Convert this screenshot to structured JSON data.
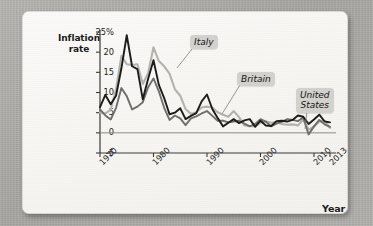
{
  "figure": {
    "y_axis_title_line1": "Inflation",
    "y_axis_title_line2": "rate",
    "x_axis_title": "Year"
  },
  "callouts": {
    "italy": "Italy",
    "britain": "Britain",
    "united_states_line1": "United",
    "united_states_line2": "States"
  },
  "colors": {
    "italy": "#b3b2ae",
    "britain": "#1c1c1c",
    "united_states": "#6e6e6c",
    "axis": "#3a3a38",
    "zero_line": "#8d8d8a",
    "callout_bg": "#d2d1cd",
    "card_bg": "#f8f7f4",
    "page_bg": "#adaca8"
  },
  "chart_data": {
    "type": "line",
    "title": "",
    "subtitle": "",
    "xlabel": "Year",
    "ylabel": "Inflation rate",
    "grid": false,
    "legend_position": "inline-callouts",
    "xlim": [
      1970,
      2013
    ],
    "ylim": [
      -5,
      25
    ],
    "ytick_labels": [
      "25%",
      "20",
      "15",
      "10",
      "5",
      "0",
      "-5"
    ],
    "ytick_values": [
      25,
      20,
      15,
      10,
      5,
      0,
      -5
    ],
    "xtick_labels": [
      "1970",
      "1980",
      "1990",
      "2000",
      "2010",
      "2013"
    ],
    "xtick_values": [
      1970,
      1980,
      1990,
      2000,
      2010,
      2013
    ],
    "x": [
      1970,
      1971,
      1972,
      1973,
      1974,
      1975,
      1976,
      1977,
      1978,
      1979,
      1980,
      1981,
      1982,
      1983,
      1984,
      1985,
      1986,
      1987,
      1988,
      1989,
      1990,
      1991,
      1992,
      1993,
      1994,
      1995,
      1996,
      1997,
      1998,
      1999,
      2000,
      2001,
      2002,
      2003,
      2004,
      2005,
      2006,
      2007,
      2008,
      2009,
      2010,
      2011,
      2012,
      2013
    ],
    "series": [
      {
        "name": "Italy",
        "color": "#b3b2ae",
        "values": [
          5.0,
          4.8,
          5.7,
          10.8,
          19.1,
          17.0,
          16.8,
          17.0,
          12.1,
          14.8,
          21.2,
          17.8,
          16.5,
          14.7,
          10.8,
          9.2,
          5.9,
          4.7,
          5.1,
          6.3,
          6.5,
          6.3,
          5.1,
          4.5,
          4.0,
          5.4,
          3.9,
          1.8,
          1.7,
          1.6,
          2.5,
          2.8,
          2.5,
          2.7,
          2.2,
          2.0,
          2.1,
          1.8,
          3.3,
          0.8,
          1.5,
          2.8,
          3.0,
          1.2
        ]
      },
      {
        "name": "Britain",
        "color": "#1c1c1c",
        "values": [
          6.4,
          9.4,
          7.1,
          9.2,
          16.0,
          24.2,
          16.5,
          15.8,
          8.3,
          13.4,
          18.0,
          11.9,
          8.6,
          4.6,
          5.0,
          6.1,
          3.4,
          4.2,
          4.9,
          7.8,
          9.5,
          5.9,
          3.7,
          1.6,
          2.5,
          3.4,
          2.4,
          3.1,
          3.4,
          1.5,
          3.0,
          1.8,
          1.7,
          2.9,
          3.0,
          2.8,
          3.2,
          4.3,
          4.0,
          2.2,
          3.3,
          4.5,
          2.8,
          2.6
        ]
      },
      {
        "name": "United States",
        "color": "#6e6e6c",
        "values": [
          5.8,
          4.3,
          3.3,
          6.2,
          11.1,
          9.1,
          5.8,
          6.5,
          7.6,
          11.3,
          13.5,
          10.3,
          6.2,
          3.2,
          4.3,
          3.6,
          1.9,
          3.6,
          4.1,
          4.8,
          5.4,
          4.2,
          3.0,
          3.0,
          2.6,
          2.8,
          3.0,
          2.3,
          1.6,
          2.2,
          3.4,
          2.8,
          1.6,
          2.3,
          2.7,
          3.4,
          3.2,
          2.9,
          3.8,
          -0.4,
          1.6,
          3.2,
          2.1,
          1.5
        ]
      }
    ]
  }
}
